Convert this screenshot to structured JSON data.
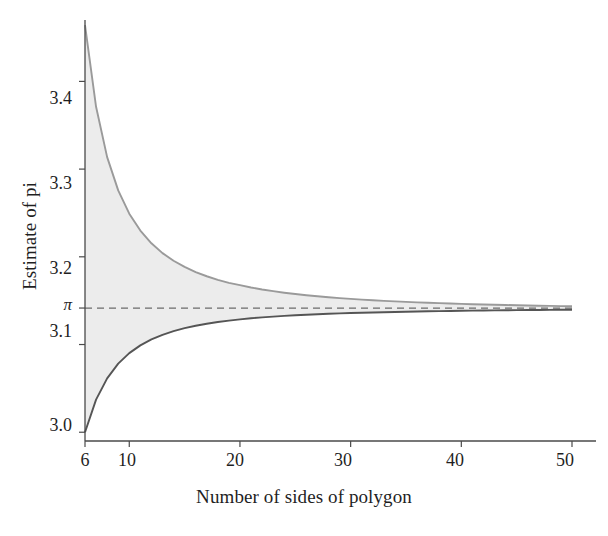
{
  "chart_data": {
    "type": "area",
    "title": "",
    "subtitle": "",
    "xlabel": "Number of sides of polygon",
    "ylabel": "Estimate of pi",
    "xlim": [
      6,
      50
    ],
    "ylim": [
      2.99,
      3.47
    ],
    "grid": false,
    "legend": null,
    "xticks": [
      {
        "value": 6,
        "label": "6"
      },
      {
        "value": 10,
        "label": "10"
      },
      {
        "value": 20,
        "label": "20"
      },
      {
        "value": 30,
        "label": "30"
      },
      {
        "value": 40,
        "label": "40"
      },
      {
        "value": 50,
        "label": "50"
      }
    ],
    "yticks": [
      {
        "value": 3.4,
        "label": "3.4"
      },
      {
        "value": 3.3,
        "label": "3.3"
      },
      {
        "value": 3.2,
        "label": "3.2"
      },
      {
        "value": 3.14159,
        "label": "π"
      },
      {
        "value": 3.1,
        "label": "3.1"
      },
      {
        "value": 3.0,
        "label": "3.0"
      }
    ],
    "annotations": [
      {
        "name": "pi-reference-line",
        "type": "hline",
        "value": 3.14159,
        "style": "dashed",
        "color": "#6b6b6b"
      }
    ],
    "x": [
      6,
      7,
      8,
      9,
      10,
      11,
      12,
      13,
      14,
      15,
      16,
      17,
      18,
      19,
      20,
      21,
      22,
      23,
      24,
      25,
      26,
      27,
      28,
      29,
      30,
      31,
      32,
      33,
      34,
      35,
      36,
      37,
      38,
      39,
      40,
      41,
      42,
      43,
      44,
      45,
      46,
      47,
      48,
      49,
      50
    ],
    "series": [
      {
        "name": "Circumscribed polygon",
        "type": "line",
        "color": "#9a9a9a",
        "values": [
          3.4641016,
          3.3710223,
          3.3137085,
          3.2757321,
          3.249197,
          3.2298914,
          3.2153903,
          3.2042288,
          3.1954603,
          3.1884505,
          3.1826484,
          3.1778335,
          3.1737961,
          3.170362,
          3.1676888,
          3.1650644,
          3.1628014,
          3.1608291,
          3.1590978,
          3.157568,
          3.1562081,
          3.1549919,
          3.1538996,
          3.1529142,
          3.1520216,
          3.1512103,
          3.15047,
          3.1497931,
          3.1491723,
          3.1486017,
          3.148076,
          3.1475903,
          3.1471409,
          3.1467243,
          3.1463374,
          3.1459775,
          3.1456423,
          3.1453295,
          3.1450373,
          3.144764,
          3.1445078,
          3.1442676,
          3.1440418,
          3.1438294,
          3.1436295
        ]
      },
      {
        "name": "Inscribed polygon",
        "type": "line",
        "color": "#555555",
        "values": [
          3.0,
          3.0371861,
          3.0614675,
          3.0781813,
          3.0901699,
          3.0990581,
          3.1058285,
          3.1111039,
          3.1152931,
          3.1186754,
          3.1214452,
          3.1237418,
          3.1256672,
          3.1272972,
          3.1286893,
          3.1298879,
          3.1309268,
          3.1318326,
          3.1326286,
          3.1333308,
          3.1339534,
          3.1345085,
          3.135006,
          3.1354541,
          3.1358599,
          3.136229,
          3.1365485,
          3.1368586,
          3.1371427,
          3.137404,
          3.137645,
          3.1378678,
          3.1380742,
          3.1382659,
          3.1384441,
          3.1386102,
          3.1387651,
          3.13891,
          3.1390456,
          3.1391728,
          3.1392922,
          3.1394045,
          3.1395103,
          3.13961,
          3.1397042
        ]
      }
    ],
    "fill_between": {
      "name": "bounds-band",
      "upper_series": "Circumscribed polygon",
      "lower_series": "Inscribed polygon",
      "color": "#ececec"
    }
  },
  "colors": {
    "axis": "#4a4a4a",
    "upper_curve": "#9a9a9a",
    "lower_curve": "#555555",
    "band_fill": "#ececec",
    "pi_line": "#6b6b6b",
    "text": "#1f1f1f",
    "background": "#ffffff"
  }
}
